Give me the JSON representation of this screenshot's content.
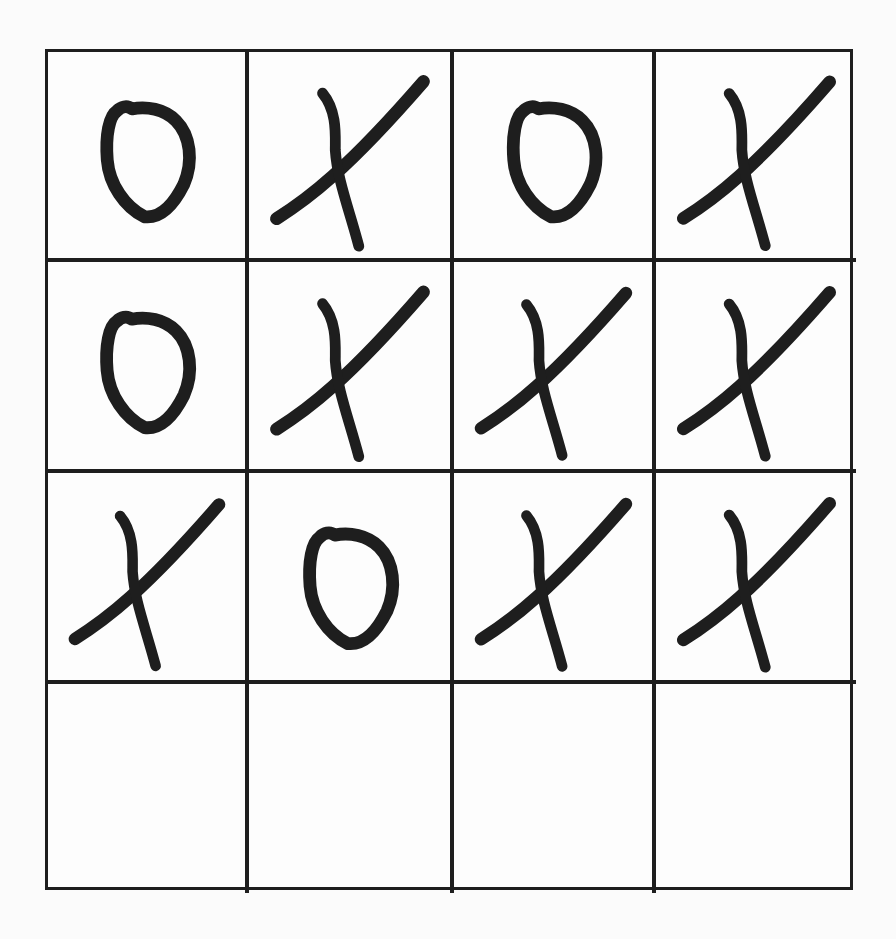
{
  "board": {
    "rows": 4,
    "cols": 4,
    "cells": [
      [
        "O",
        "X",
        "O",
        "X"
      ],
      [
        "O",
        "X",
        "X",
        "X"
      ],
      [
        "X",
        "O",
        "X",
        "X"
      ],
      [
        "",
        "",
        "",
        ""
      ]
    ]
  },
  "colors": {
    "ink": "#1e1e1e",
    "paper": "#fdfdfd"
  }
}
